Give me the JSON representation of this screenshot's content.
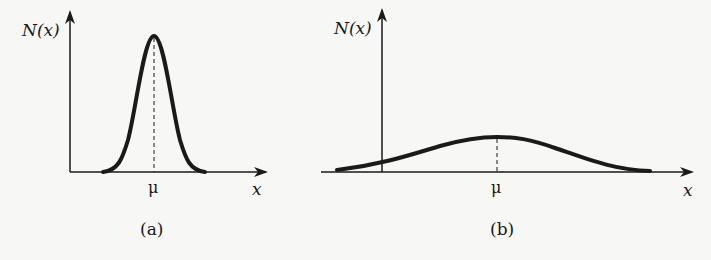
{
  "figure": {
    "panels": [
      {
        "id": "a",
        "caption": "(a)",
        "y_axis_label": "N(x)",
        "x_axis_label": "x",
        "mean_label": "μ",
        "description": "narrow, tall bell curve (small variance)"
      },
      {
        "id": "b",
        "caption": "(b)",
        "y_axis_label": "N(x)",
        "x_axis_label": "x",
        "mean_label": "μ",
        "description": "wide, flat bell curve (large variance)"
      }
    ],
    "colors": {
      "ink": "#1a1a1a",
      "background": "#f7f7f5"
    }
  }
}
